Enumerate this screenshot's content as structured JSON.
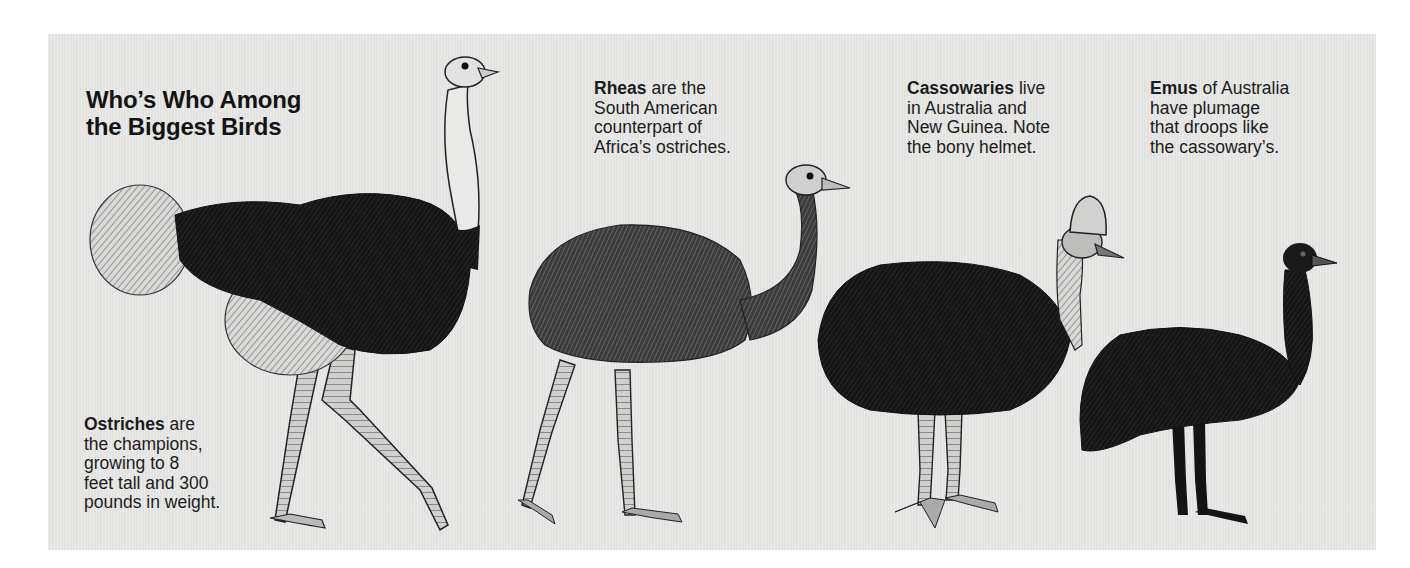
{
  "page": {
    "title_line1": "Who’s Who Among",
    "title_line2": "the Biggest Birds",
    "background_color": "#e6e6e4"
  },
  "birds": [
    {
      "id": "ostrich",
      "name": "Ostriches",
      "caption_lines": [
        "are",
        "the champions,",
        "growing to 8",
        "feet tall and 300",
        "pounds in weight."
      ],
      "illustration": "ostrich-illustration"
    },
    {
      "id": "rhea",
      "name": "Rheas",
      "caption_lines": [
        "are the",
        "South American",
        "counterpart of",
        "Africa’s ostriches."
      ],
      "illustration": "rhea-illustration"
    },
    {
      "id": "cassowary",
      "name": "Cassowaries",
      "caption_lines": [
        "live",
        "in Australia and",
        "New Guinea. Note",
        "the bony helmet."
      ],
      "illustration": "cassowary-illustration"
    },
    {
      "id": "emu",
      "name": "Emus",
      "caption_lines": [
        "of Australia",
        "have plumage",
        "that droops like",
        "the cassowary’s."
      ],
      "illustration": "emu-illustration"
    }
  ]
}
